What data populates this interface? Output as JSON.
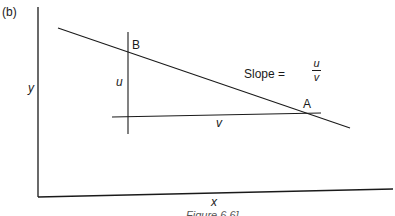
{
  "figure": {
    "panel_label": "(b)",
    "caption": "Figure 6.6]",
    "axes": {
      "x_label": "x",
      "y_label": "y"
    },
    "points": {
      "A": "A",
      "B": "B"
    },
    "segments": {
      "vertical_rise": "u",
      "horizontal_run": "v"
    },
    "slope_annotation": {
      "prefix": "Slope =",
      "numerator": "u",
      "denominator": "v"
    },
    "colors": {
      "line": "#1a1a1a",
      "background": "#ffffff"
    }
  }
}
